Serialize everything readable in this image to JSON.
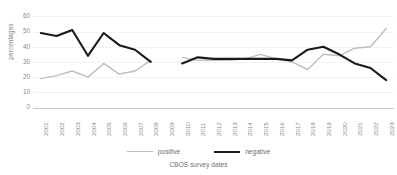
{
  "chart_data": {
    "type": "line",
    "title": "",
    "xlabel": "CBOS survey dates",
    "ylabel": "percentages",
    "ylim": [
      0,
      60
    ],
    "yticks": [
      0,
      10,
      20,
      30,
      40,
      50,
      60
    ],
    "grid": true,
    "legend_position": "bottom",
    "categories": [
      "2001",
      "2002",
      "2003",
      "2004",
      "2005",
      "2006",
      "2007",
      "2008",
      "2009",
      "2010",
      "2011",
      "2012",
      "2013",
      "2014",
      "2015",
      "2016",
      "2017",
      "2018",
      "2019",
      "2020",
      "2021",
      "2022",
      "2023"
    ],
    "series": [
      {
        "name": "positive",
        "color": "#bfbfbf",
        "values": [
          19,
          21,
          24,
          20,
          29,
          22,
          24,
          31,
          null,
          33,
          31,
          31,
          31,
          32,
          35,
          32,
          30,
          25,
          35,
          34,
          39,
          40,
          52
        ]
      },
      {
        "name": "negative",
        "color": "#1a1a1a",
        "values": [
          49,
          47,
          51,
          34,
          49,
          41,
          38,
          30,
          null,
          29,
          33,
          32,
          32,
          32,
          32,
          32,
          31,
          38,
          40,
          35,
          29,
          26,
          18
        ]
      }
    ]
  },
  "legend": {
    "items": [
      {
        "label": "positive",
        "style": "pos"
      },
      {
        "label": "negative",
        "style": "neg"
      }
    ]
  },
  "axis": {
    "x_title": "CBOS survey dates",
    "y_title": "percentages"
  }
}
